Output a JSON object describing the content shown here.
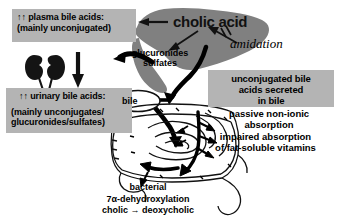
{
  "figure": {
    "colors": {
      "box_fill": "#b4b4b4",
      "liver_fill": "#808080",
      "kidney_fill": "#1a1a1a",
      "outline": "#000000",
      "background": "#ffffff"
    }
  },
  "boxes": {
    "plasma": {
      "line1": "↑↑ plasma bile acids:",
      "line2": "(mainly unconjugated)"
    },
    "urinary": {
      "line1": "↑↑ urinary bile acids:",
      "line2": "(mainly unconjugates/",
      "line3": "glucuronides/sulfates)"
    },
    "secreted": {
      "line1": "unconjugated bile",
      "line2": "acids secreted",
      "line3": "in bile"
    }
  },
  "captions": {
    "passive": {
      "line1": "passive non-ionic",
      "line2": "absorption"
    },
    "impaired": {
      "line1": "impaired absorption",
      "line2": "of fat-soluble vitamins"
    },
    "bacterial": {
      "line1": "bacterial",
      "line2": "7α-dehydroxylation",
      "line3": "cholic → deoxycholic"
    }
  },
  "labels": {
    "cholic_acid": "cholic acid",
    "glucuronides": "glucuronides",
    "sulfates": "sulfates",
    "amidation": "amidation",
    "bile": "bile"
  },
  "organs": {
    "liver": "liver",
    "kidneys": "kidneys",
    "gallbladder": "gallbladder",
    "small_intestine": "small-intestine",
    "colon": "colon"
  },
  "arrows": {
    "plasma_from_liver": "arrow-left-to-plasma-box",
    "plasma_to_urinary": "arrow-down-to-urinary-box",
    "liver_to_glucuronides": "arrow-cholic-to-glucuronides",
    "amidation_blocked": "arrow-amidation-blocked",
    "glucuronides_to_plasma": "arrow-glucuronides-to-plasma",
    "liver_to_bile": "arrow-liver-to-bile",
    "bile_to_intestine": "arrow-bile-into-intestine",
    "intestine_absorption": "arrows-intestinal-absorption",
    "colon_transit": "arrow-colon-transit"
  }
}
